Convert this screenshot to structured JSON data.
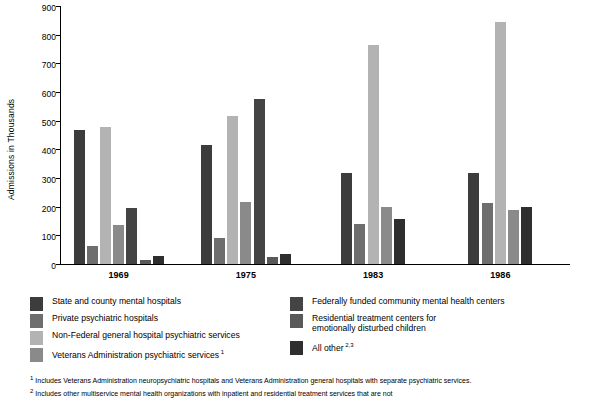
{
  "chart_data": {
    "type": "bar",
    "title": "",
    "xlabel": "",
    "ylabel": "Admissions in Thousands",
    "ylim": [
      0,
      900
    ],
    "yticks": [
      0,
      100,
      200,
      300,
      400,
      500,
      600,
      700,
      800,
      900
    ],
    "grid": false,
    "legend_position": "below",
    "categories": [
      "1969",
      "1975",
      "1983",
      "1986"
    ],
    "series": [
      {
        "name": "State and county mental hospitals",
        "color": "#3c3c3c",
        "values": [
          467,
          414,
          318,
          317
        ]
      },
      {
        "name": "Private psychiatric hospitals",
        "color": "#6e6e6e",
        "values": [
          63,
          92,
          141,
          212
        ]
      },
      {
        "name": "Non-Federal general hospital psychiatric services",
        "color": "#b3b3b3",
        "values": [
          478,
          516,
          764,
          843
        ]
      },
      {
        "name": "Veterans Administration psychiatric services",
        "color": "#8a8a8a",
        "values": [
          136,
          215,
          198,
          190
        ]
      },
      {
        "name": "Federally funded community mental health centers",
        "color": "#444444",
        "values": [
          196,
          574,
          0,
          0
        ]
      },
      {
        "name": "Residential treatment centers for emotionally disturbed children",
        "color": "#595959",
        "values": [
          15,
          26,
          0,
          0
        ]
      },
      {
        "name": "All other",
        "color": "#2e2e2e",
        "values": [
          28,
          34,
          156,
          199
        ]
      }
    ]
  },
  "legend": {
    "left": [
      {
        "label": "State and county mental hospitals",
        "color": "#3c3c3c",
        "sup": ""
      },
      {
        "label": "Private psychiatric hospitals",
        "color": "#6e6e6e",
        "sup": ""
      },
      {
        "label": "Non-Federal general hospital psychiatric services",
        "color": "#b3b3b3",
        "sup": ""
      },
      {
        "label": "Veterans Administration psychiatric services",
        "color": "#8a8a8a",
        "sup": "1"
      }
    ],
    "right": [
      {
        "label": "Federally funded community mental health centers",
        "color": "#444444",
        "sup": ""
      },
      {
        "label": "Residential treatment centers for\nemotionally disturbed children",
        "color": "#595959",
        "sup": ""
      },
      {
        "label": "All other",
        "color": "#2e2e2e",
        "sup": "2,3"
      }
    ]
  },
  "footnotes": [
    {
      "num": "1",
      "text": "Includes Veterans Administration neuropsychiatric hospitals and Veterans Administration general hospitals with separate psychiatric services."
    },
    {
      "num": "2",
      "text": "Includes other multiservice mental health organizations with inpatient and residential treatment services that are not"
    }
  ]
}
